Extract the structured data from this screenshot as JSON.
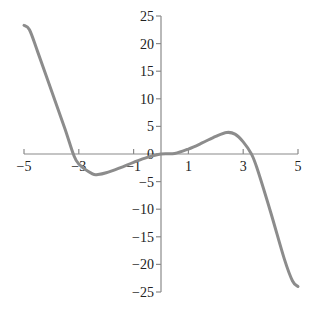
{
  "chart_data": {
    "type": "line",
    "title": "",
    "xlabel": "",
    "ylabel": "",
    "xlim": [
      -5,
      5
    ],
    "ylim": [
      -25,
      25
    ],
    "x_ticks": [
      -5,
      -3,
      -1,
      1,
      3,
      5
    ],
    "y_ticks": [
      25,
      20,
      15,
      10,
      5,
      0,
      -5,
      -10,
      -15,
      -20,
      -25
    ],
    "grid": false,
    "legend": null,
    "colors": {
      "curve": "#8c8c8c",
      "axis": "#8a8a8a",
      "text": "#222222"
    },
    "series": [
      {
        "name": "f(x)",
        "x": [
          -5,
          -4.8,
          -4.5,
          -4,
          -3.5,
          -3.2,
          -3,
          -2.5,
          -2.3,
          -2,
          -1.5,
          -1,
          -0.5,
          0,
          0.5,
          1,
          1.5,
          2,
          2.4,
          2.7,
          3,
          3.3,
          3.5,
          4,
          4.5,
          4.8,
          5
        ],
        "y": [
          23.3,
          22.5,
          18.5,
          11.5,
          4.5,
          0,
          -1.8,
          -3.6,
          -3.7,
          -3.4,
          -2.5,
          -1.5,
          -0.6,
          0,
          0.1,
          0.9,
          2.0,
          3.2,
          3.9,
          3.6,
          2.2,
          0,
          -2.5,
          -10.5,
          -19,
          -23,
          -24
        ]
      }
    ]
  }
}
